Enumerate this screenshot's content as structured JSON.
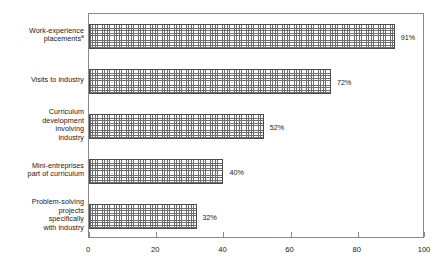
{
  "chart_data": {
    "type": "bar",
    "orientation": "horizontal",
    "title": "",
    "subtitle": "",
    "xlabel": "",
    "ylabel": "",
    "xlim": [
      0,
      100
    ],
    "xticks": [
      0,
      20,
      40,
      60,
      80,
      100
    ],
    "xtick_labels": [
      "0",
      "20",
      "40",
      "60",
      "80",
      "100"
    ],
    "grid": false,
    "legend": false,
    "categories": [
      "Work-experience placements",
      "Visits to industry",
      "Curriculum development involving industry",
      "Mini-entreprises part of curriculum",
      "Problem-solving projects specifically with industry"
    ],
    "category_lines": [
      [
        "Work-experience",
        "placements"
      ],
      [
        "Visits to industry"
      ],
      [
        "Curriculum",
        "development",
        "involving",
        "industry"
      ],
      [
        "Mini-entreprises",
        "part of curriculum"
      ],
      [
        "Problem-solving",
        "projects",
        "specifically",
        "with industry"
      ]
    ],
    "category_footnote_markers": [
      "a",
      "",
      "",
      "",
      ""
    ],
    "values": [
      91,
      72,
      52,
      40,
      32
    ],
    "value_labels": [
      "91%",
      "72%",
      "52%",
      "40%",
      "32%"
    ],
    "colors": {
      "bar_fill": "#fdfdfd",
      "bar_hatch": "#6d6d6d",
      "bar_border": "#4a4a4a",
      "frame": "#8a8a8a",
      "text": "#1a1a1a",
      "background": "#ffffff"
    }
  }
}
